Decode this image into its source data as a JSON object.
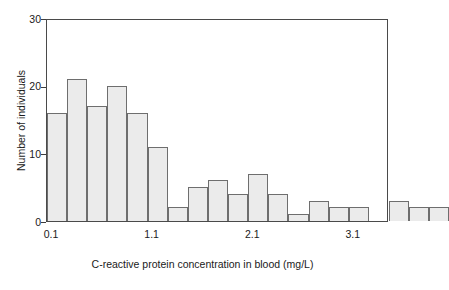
{
  "chart_data": {
    "type": "bar",
    "title": "",
    "subtitle": "",
    "xlabel": "C-reactive protein concentration in blood (mg/L)",
    "ylabel": "Number of individuals",
    "xlim": [
      0.05,
      3.45
    ],
    "ylim": [
      0,
      30
    ],
    "bin_width": 0.2,
    "grid": false,
    "legend": null,
    "annotations": [],
    "y_ticks": [
      0,
      10,
      20,
      30
    ],
    "y_tick_labels": [
      "0",
      "10",
      "20",
      "30"
    ],
    "x_ticks": [
      0.1,
      1.1,
      2.1,
      3.1
    ],
    "x_tick_labels": [
      "0.1",
      "1.1",
      "2.1",
      "3.1"
    ],
    "categories": [
      "0.1",
      "0.3",
      "0.5",
      "0.7",
      "0.9",
      "1.1",
      "1.3",
      "1.5",
      "1.7",
      "1.9",
      "2.1",
      "2.3",
      "2.5",
      "2.7",
      "2.9",
      "3.1",
      "3.3"
    ],
    "bin_starts": [
      0.05,
      0.25,
      0.45,
      0.65,
      0.85,
      1.05,
      1.25,
      1.45,
      1.65,
      1.85,
      2.05,
      2.25,
      2.45,
      2.65,
      2.85,
      3.05,
      3.25
    ],
    "values": [
      16,
      21,
      17,
      20,
      16,
      11,
      2,
      5,
      6,
      4,
      7,
      4,
      1,
      3,
      2,
      2,
      0
    ],
    "bars": [
      {
        "index": 0,
        "center": "0.1",
        "value": 16
      },
      {
        "index": 1,
        "center": "0.3",
        "value": 21
      },
      {
        "index": 2,
        "center": "0.5",
        "value": 17
      },
      {
        "index": 3,
        "center": "0.7",
        "value": 20
      },
      {
        "index": 4,
        "center": "0.9",
        "value": 16
      },
      {
        "index": 5,
        "center": "1.1",
        "value": 11
      },
      {
        "index": 6,
        "center": "1.3",
        "value": 2
      },
      {
        "index": 7,
        "center": "1.5",
        "value": 5
      },
      {
        "index": 8,
        "center": "1.7",
        "value": 6
      },
      {
        "index": 9,
        "center": "1.9",
        "value": 4
      },
      {
        "index": 10,
        "center": "2.1",
        "value": 7
      },
      {
        "index": 11,
        "center": "2.3",
        "value": 4
      },
      {
        "index": 12,
        "center": "2.5",
        "value": 1
      },
      {
        "index": 13,
        "center": "2.7",
        "value": 3
      },
      {
        "index": 14,
        "center": "2.9",
        "value": 2
      },
      {
        "index": 15,
        "center": "3.1",
        "value": 2
      },
      {
        "index": 16,
        "center": "3.3",
        "value": 0
      },
      {
        "index": 17,
        "center": "3.5",
        "value": 3
      },
      {
        "index": 18,
        "center": "3.7",
        "value": 2
      },
      {
        "index": 19,
        "center": "3.9",
        "value": 2
      }
    ],
    "colors": {
      "bar_fill": "#ebebeb",
      "bar_edge": "#6e6e6e",
      "axis": "#4a4a4a",
      "text": "#1a1a1a",
      "background": "#ffffff"
    }
  }
}
